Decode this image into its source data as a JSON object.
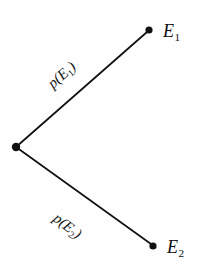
{
  "figure": {
    "kind": "probability-branch-diagram",
    "background_color": "#fefefe",
    "ink_color": "#111111",
    "width": 200,
    "height": 273
  },
  "nodes": [
    {
      "id": "origin",
      "label": "",
      "x": 16,
      "y": 147,
      "dot_radius": 4.2
    },
    {
      "id": "e1",
      "label_main": "E",
      "label_sub": "1",
      "x": 149,
      "y": 30,
      "dot_radius": 3.6
    },
    {
      "id": "e2",
      "label_main": "E",
      "label_sub": "2",
      "x": 153,
      "y": 246,
      "dot_radius": 3.6
    }
  ],
  "branches": [
    {
      "id": "upper",
      "from": "origin",
      "to": "e1",
      "label_main": "p(E",
      "label_sub": "1",
      "label_tail": ")",
      "rotation_deg": -41,
      "x1": 16,
      "y1": 147,
      "x2": 147,
      "y2": 32
    },
    {
      "id": "lower",
      "from": "origin",
      "to": "e2",
      "label_main": "p(E",
      "label_sub": "2",
      "label_tail": ")",
      "rotation_deg": 38,
      "x1": 16,
      "y1": 147,
      "x2": 151,
      "y2": 244
    }
  ],
  "labels": {
    "node_e1_main": "E",
    "node_e1_sub": "1",
    "node_e2_main": "E",
    "node_e2_sub": "2",
    "branch_upper_main": "p(E",
    "branch_upper_sub": "1",
    "branch_upper_tail": ")",
    "branch_lower_main": "p(E",
    "branch_lower_sub": "2",
    "branch_lower_tail": ")"
  }
}
